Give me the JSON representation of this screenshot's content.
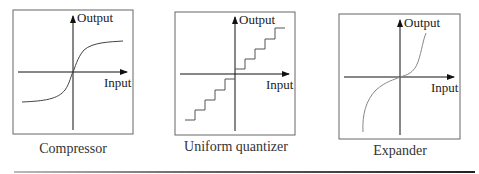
{
  "panels": [
    {
      "id": "compressor",
      "caption": "Compressor",
      "y_axis_label": "Output",
      "x_axis_label": "Input",
      "curve_type": "s-curve (compressive)"
    },
    {
      "id": "uniform-quantizer",
      "caption": "Uniform quantizer",
      "y_axis_label": "Output",
      "x_axis_label": "Input",
      "curve_type": "staircase"
    },
    {
      "id": "expander",
      "caption": "Expander",
      "y_axis_label": "Output",
      "x_axis_label": "Input",
      "curve_type": "inverse s-curve (expansive)"
    }
  ],
  "colors": {
    "frame": "#555555",
    "axis": "#222222",
    "curve": "#444444",
    "expander_curve": "#777777"
  }
}
